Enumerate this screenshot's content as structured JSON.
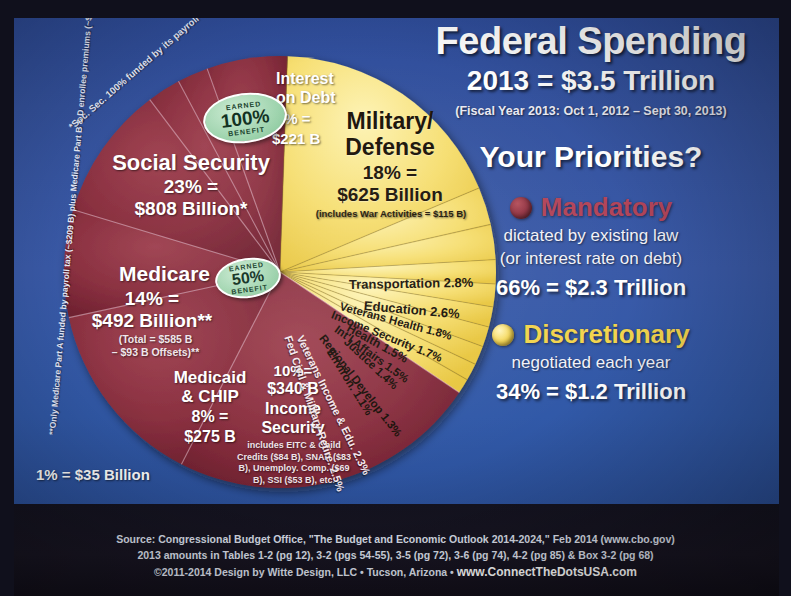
{
  "header": {
    "title": "Federal Spending",
    "subtitle": "2013 = $3.5 Trillion",
    "fiscal_year": "(Fiscal Year 2013: Oct 1, 2012 – Sept 30, 2013)",
    "question": "Your Priorities?"
  },
  "legend": {
    "mandatory": {
      "name": "Mandatory",
      "desc_line1": "dictated by existing law",
      "desc_line2": "(or interest rate on debt)",
      "total": "66% = $2.3 Trillion",
      "color": "#8e3140"
    },
    "discretionary": {
      "name": "Discretionary",
      "desc_line1": "negotiated each year",
      "total": "34% = $1.2 Trillion",
      "color": "#f4d552"
    }
  },
  "scale_note": "1% = $35 Billion",
  "footnotes": {
    "social_security": "*Soc. Sec. 100% funded by its payroll tax & trust fund",
    "medicare": "**Only Medicare Part A funded by payroll tax (~$209 B) plus Medicare Part B & D enrollee premiums (~$66 B)"
  },
  "badges": {
    "social_security": {
      "top": "EARNED",
      "value": "100%",
      "bottom": "BENEFIT"
    },
    "medicare": {
      "top": "EARNED",
      "value": "50%",
      "bottom": "BENEFIT"
    }
  },
  "slices": {
    "social_security": {
      "name": "Social Security",
      "pct_line": "23% =",
      "amount": "$808 Billion*"
    },
    "medicare": {
      "name": "Medicare",
      "pct_line": "14% =",
      "amount": "$492 Billion**",
      "note_line1": "(Total = $585 B",
      "note_line2": "– $93 B Offsets)**"
    },
    "medicaid": {
      "name_line1": "Medicaid",
      "name_line2": "& CHIP",
      "pct_line": "8% =",
      "amount": "$275 B"
    },
    "income_security": {
      "pct_line": "10%=",
      "amount": "$340 B",
      "name_line1": "Income",
      "name_line2": "Security",
      "detail": "includes EITC & Child Credits ($84 B), SNAP ($83 B), Unemploy. Comp. ($69 B), SSI ($53 B), etc."
    },
    "interest": {
      "name_line1": "Interest",
      "name_line2": "on Debt",
      "pct_line": "6% =",
      "amount": "$221 B"
    },
    "military": {
      "name_line1": "Military/",
      "name_line2": "Defense",
      "pct_line": "18% =",
      "amount": "$625 Billion",
      "note": "(includes War Activities = $115 B)"
    }
  },
  "chart_data": {
    "type": "pie",
    "title": "Federal Spending 2013 = $3.5 Trillion",
    "total": "$3.5 Trillion",
    "unit_note": "1% = $35 Billion",
    "legend_position": "right",
    "categories": [
      "Mandatory",
      "Discretionary"
    ],
    "series": [
      {
        "label": "Social Security",
        "value": 23,
        "amount": "$808 Billion",
        "group": "Mandatory",
        "color": "#8e3140"
      },
      {
        "label": "Medicare",
        "value": 14,
        "amount": "$492 Billion",
        "group": "Mandatory",
        "color": "#8e3140"
      },
      {
        "label": "Medicaid & CHIP",
        "value": 8,
        "amount": "$275 B",
        "group": "Mandatory",
        "color": "#8e3140"
      },
      {
        "label": "Income Security",
        "value": 10,
        "amount": "$340 B",
        "group": "Mandatory",
        "color": "#8e3140"
      },
      {
        "label": "Fed Civil & Military Retire.",
        "value": 2.5,
        "group": "Mandatory",
        "color": "#8e3140"
      },
      {
        "label": "Veterans Income & Edu.",
        "value": 2.3,
        "group": "Mandatory",
        "color": "#8e3140"
      },
      {
        "label": "Interest on Debt",
        "value": 6,
        "amount": "$221 B",
        "group": "Mandatory",
        "color": "#8e3140"
      },
      {
        "label": "Military/Defense",
        "value": 18,
        "amount": "$625 Billion",
        "group": "Discretionary",
        "color": "#f4d552"
      },
      {
        "label": "Transportation",
        "value": 2.8,
        "group": "Discretionary",
        "color": "#f4d552"
      },
      {
        "label": "Education",
        "value": 2.6,
        "group": "Discretionary",
        "color": "#f4d552"
      },
      {
        "label": "Veterans Health",
        "value": 1.8,
        "group": "Discretionary",
        "color": "#f4d552"
      },
      {
        "label": "Income Security",
        "value": 1.7,
        "group": "Discretionary",
        "color": "#f4d552"
      },
      {
        "label": "Health",
        "value": 1.5,
        "group": "Discretionary",
        "color": "#f4d552"
      },
      {
        "label": "Int'l Affairs",
        "value": 1.5,
        "group": "Discretionary",
        "color": "#f4d552"
      },
      {
        "label": "Justice",
        "value": 1.4,
        "group": "Discretionary",
        "color": "#f4d552"
      },
      {
        "label": "Regional Develop",
        "value": 1.3,
        "group": "Discretionary",
        "color": "#f4d552"
      },
      {
        "label": "Environ.",
        "value": 1.1,
        "group": "Discretionary",
        "color": "#f4d552"
      }
    ],
    "group_totals": [
      {
        "name": "Mandatory",
        "pct": 66,
        "amount": "$2.3 Trillion"
      },
      {
        "name": "Discretionary",
        "pct": 34,
        "amount": "$1.2 Trillion"
      }
    ]
  },
  "thin_labels": {
    "transportation": "Transportation 2.8%",
    "education": "Education 2.6%",
    "veterans_health": "Veterans Health 1.8%",
    "income_security_d": "Income Security 1.7%",
    "health": "Health 1.5%",
    "intl_affairs": "Int'l Affairs 1.5%",
    "justice": "Justice 1.4%",
    "regional": "Regional Develop 1.3%",
    "environ": "Environ. 1.1%",
    "fed_retire": "Fed Civil & Military Retire. 2.5%",
    "veterans_income": "Veterans Income & Edu. 2.3%"
  },
  "footer": {
    "line1": "Source: Congressional Budget Office, \"The Budget and Economic Outlook 2014-2024,\" Feb 2014 (www.cbo.gov)",
    "line2": "2013 amounts in Tables 1-2 (pg 12), 3-2 (pgs 54-55), 3-5 (pg 72), 3-6 (pg 74), 4-2 (pg 85) & Box 3-2 (pg 68)",
    "line3_pre": "©2011-2014 Design by Witte Design, LLC • Tucson, Arizona • ",
    "line3_site": "www.ConnectTheDotsUSA.com"
  }
}
